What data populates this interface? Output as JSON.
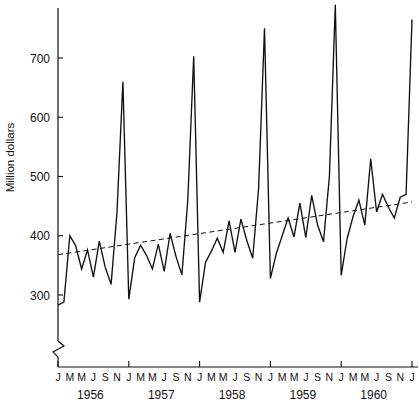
{
  "chart_data": {
    "type": "line",
    "title": "",
    "xlabel": "",
    "ylabel": "Million dollars",
    "ylim": [
      270,
      800
    ],
    "ytick_values": [
      300,
      400,
      500,
      600,
      700
    ],
    "ytick_labels": [
      "300",
      "400",
      "500",
      "600",
      "700"
    ],
    "grid": false,
    "legend": "none",
    "axis_break": true,
    "years": [
      "1956",
      "1957",
      "1958",
      "1959",
      "1960"
    ],
    "month_tick_labels": [
      "J",
      "M",
      "M",
      "J",
      "S",
      "N"
    ],
    "x_tick_sequence": [
      "J",
      "M",
      "M",
      "J",
      "S",
      "N",
      "J",
      "M",
      "M",
      "J",
      "S",
      "N",
      "J",
      "M",
      "M",
      "J",
      "S",
      "N",
      "J",
      "M",
      "M",
      "J",
      "S",
      "N",
      "J",
      "M",
      "M",
      "J",
      "S",
      "N",
      "J"
    ],
    "series": [
      {
        "name": "Monthly sales",
        "style": "solid",
        "x": [
          "1956-01",
          "1956-02",
          "1956-03",
          "1956-04",
          "1956-05",
          "1956-06",
          "1956-07",
          "1956-08",
          "1956-09",
          "1956-10",
          "1956-11",
          "1956-12",
          "1957-01",
          "1957-02",
          "1957-03",
          "1957-04",
          "1957-05",
          "1957-06",
          "1957-07",
          "1957-08",
          "1957-09",
          "1957-10",
          "1957-11",
          "1957-12",
          "1958-01",
          "1958-02",
          "1958-03",
          "1958-04",
          "1958-05",
          "1958-06",
          "1958-07",
          "1958-08",
          "1958-09",
          "1958-10",
          "1958-11",
          "1958-12",
          "1959-01",
          "1959-02",
          "1959-03",
          "1959-04",
          "1959-05",
          "1959-06",
          "1959-07",
          "1959-08",
          "1959-09",
          "1959-10",
          "1959-11",
          "1959-12",
          "1960-01",
          "1960-02",
          "1960-03",
          "1960-04",
          "1960-05",
          "1960-06",
          "1960-07",
          "1960-08",
          "1960-09",
          "1960-10",
          "1960-11",
          "1960-12",
          "1961-01"
        ],
        "values": [
          283,
          288,
          400,
          383,
          344,
          376,
          330,
          391,
          347,
          318,
          440,
          660,
          293,
          363,
          384,
          367,
          344,
          386,
          340,
          404,
          365,
          334,
          460,
          703,
          288,
          355,
          374,
          396,
          372,
          425,
          372,
          428,
          392,
          362,
          480,
          750,
          328,
          370,
          400,
          430,
          398,
          455,
          397,
          468,
          418,
          390,
          500,
          790,
          333,
          395,
          432,
          460,
          418,
          530,
          440,
          470,
          448,
          430,
          465,
          470,
          765
        ]
      },
      {
        "name": "Trend",
        "style": "dashed",
        "endpoints": [
          {
            "x": "1956-01",
            "y": 368
          },
          {
            "x": "1961-01",
            "y": 457
          }
        ]
      }
    ]
  },
  "axes": {
    "y_axis_name": "y-axis",
    "x_axis_name": "x-axis"
  }
}
